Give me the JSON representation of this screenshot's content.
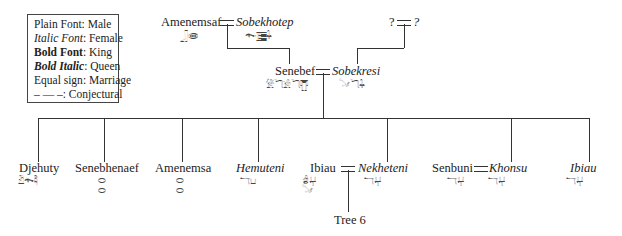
{
  "legend": {
    "items": [
      {
        "key": "Plain Font",
        "sep": ": ",
        "value": "Male"
      },
      {
        "key": "Italic Font",
        "sep": ": ",
        "value": "Female"
      },
      {
        "key": "Bold Font",
        "sep": ": ",
        "value": "King"
      },
      {
        "key": "Bold Italic",
        "sep": ": ",
        "value": "Queen"
      },
      {
        "key": "Equal sign",
        "sep": ": ",
        "value": "Marriage"
      },
      {
        "key": "–  —  –",
        "sep": ": ",
        "value": "Conjectural"
      }
    ]
  },
  "generation1": {
    "husband": {
      "name": "Amenemsaf",
      "hieroglyphs": "𓃀𓂏"
    },
    "wife": {
      "name": "Sobekhotep",
      "hieroglyphs": "𓆜𓊂𓇑"
    },
    "unknown_husband": {
      "name": "?"
    },
    "unknown_wife": {
      "name": "?"
    }
  },
  "generation2": {
    "husband": {
      "name": "Senebef",
      "hieroglyphs": "𓀍𓆓𓀀𓆓𓊀"
    },
    "wife": {
      "name": "Sobekresi",
      "hieroglyphs": "𓍁𓆓𓇑"
    }
  },
  "children": [
    {
      "name": "Djehuty",
      "style": "plain",
      "hieroglyphs": "𓁟𓆜𓄻"
    },
    {
      "name": "Senebhenaef",
      "style": "plain",
      "hieroglyphs": "⬭\n⬭"
    },
    {
      "name": "Amenemsa",
      "style": "plain",
      "hieroglyphs": "⬭\n⬭"
    },
    {
      "name": "Hemuteni",
      "style": "italic",
      "hieroglyphs": "𓄓𓂓"
    },
    {
      "name": "Ibiau",
      "style": "plain",
      "hieroglyphs": "𓁓𓂔\n𓍁"
    },
    {
      "name": "Nekheteni",
      "style": "italic",
      "hieroglyphs": "𓄓𓂔"
    },
    {
      "name": "Senbuni",
      "style": "plain",
      "hieroglyphs": "𓄓𓂔"
    },
    {
      "name": "Khonsu",
      "style": "italic",
      "hieroglyphs": "𓄓𓂔"
    },
    {
      "name": "Ibiau",
      "style": "italic",
      "hieroglyphs": "𓄓𓂔"
    }
  ],
  "reference": {
    "label": "Tree 6"
  }
}
